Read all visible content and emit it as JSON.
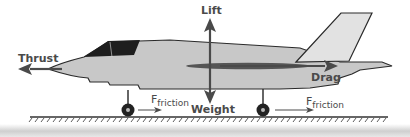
{
  "diagram": {
    "labels": {
      "lift": "Lift",
      "weight": "Weight",
      "thrust": "Thrust",
      "drag": "Drag",
      "friction_front_main": "F",
      "friction_front_sub": "friction",
      "friction_rear_main": "F",
      "friction_rear_sub": "friction"
    },
    "colors": {
      "fuselage": "#c8c8c8",
      "canopy": "#1e1e1e",
      "outline": "#2a2a2a",
      "arrow": "#4a4a4a",
      "wing": "#555555",
      "tail": "#e2e2e2",
      "ground": "#333333"
    }
  }
}
